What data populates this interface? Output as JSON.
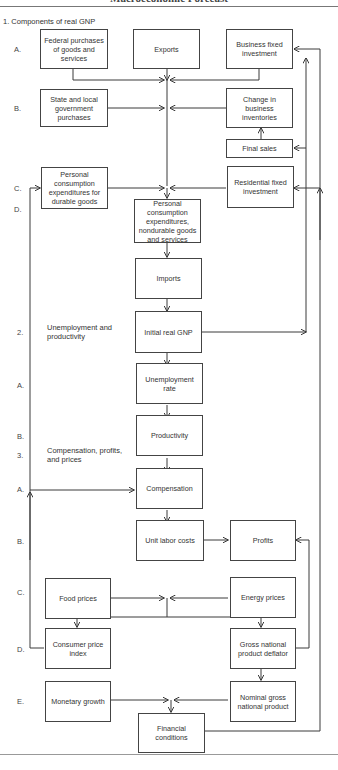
{
  "header": {
    "title": "Macroeconomic Forecast"
  },
  "sections": [
    {
      "id": "s1",
      "label": "1.  Components of real GNP"
    },
    {
      "id": "s2_num",
      "label": "2."
    },
    {
      "id": "s2",
      "label": "Unemployment and productivity"
    },
    {
      "id": "s3_num",
      "label": "3."
    },
    {
      "id": "s3",
      "label": "Compensation, profits, and prices"
    }
  ],
  "row_labels": {
    "s1": [
      "A.",
      "B.",
      "C.",
      "D."
    ],
    "s2": [
      "A.",
      "B."
    ],
    "s3": [
      "A.",
      "B.",
      "C.",
      "D.",
      "E."
    ]
  },
  "boxes": {
    "federal": "Federal purchases of goods and services",
    "exports": "Exports",
    "business_fixed": "Business fixed investment",
    "state_local": "State and local government purchases",
    "inventories": "Change in business inventories",
    "final_sales": "Final sales",
    "durables": "Personal consumption expenditures for durable goods",
    "residential": "Residential fixed investment",
    "nondurables": "Personal consumption expenditures, nondurable goods and services",
    "imports": "Imports",
    "initial_gnp": "Initial real GNP",
    "unemployment": "Unemployment rate",
    "productivity": "Productivity",
    "compensation": "Compensation",
    "unit_labor": "Unit labor costs",
    "profits": "Profits",
    "food": "Food prices",
    "energy": "Energy prices",
    "cpi": "Consumer price index",
    "deflator": "Gross national product deflator",
    "monetary": "Monetary growth",
    "nominal_gnp": "Nominal gross national product",
    "financial": "Financial conditions"
  }
}
